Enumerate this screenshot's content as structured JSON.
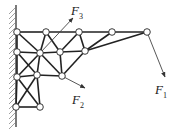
{
  "diagram": {
    "wall": {
      "x": 16,
      "y1": 5,
      "y2": 127
    },
    "nodes": [
      {
        "id": "A",
        "x": 17,
        "y": 32
      },
      {
        "id": "B",
        "x": 46,
        "y": 32
      },
      {
        "id": "C",
        "x": 79,
        "y": 32
      },
      {
        "id": "D",
        "x": 112,
        "y": 32
      },
      {
        "id": "E",
        "x": 147,
        "y": 32
      },
      {
        "id": "F",
        "x": 17,
        "y": 52
      },
      {
        "id": "G",
        "x": 40,
        "y": 53
      },
      {
        "id": "H",
        "x": 60,
        "y": 52
      },
      {
        "id": "I",
        "x": 85,
        "y": 51
      },
      {
        "id": "J",
        "x": 17,
        "y": 77
      },
      {
        "id": "K",
        "x": 37,
        "y": 75
      },
      {
        "id": "L",
        "x": 62,
        "y": 76
      },
      {
        "id": "M",
        "x": 16,
        "y": 107
      },
      {
        "id": "N",
        "x": 40,
        "y": 107
      }
    ],
    "members": [
      [
        "A",
        "B"
      ],
      [
        "B",
        "C"
      ],
      [
        "C",
        "D"
      ],
      [
        "D",
        "E"
      ],
      [
        "A",
        "F"
      ],
      [
        "F",
        "J"
      ],
      [
        "J",
        "M"
      ],
      [
        "F",
        "G"
      ],
      [
        "G",
        "H"
      ],
      [
        "H",
        "I"
      ],
      [
        "J",
        "K"
      ],
      [
        "K",
        "L"
      ],
      [
        "M",
        "N"
      ],
      [
        "A",
        "G"
      ],
      [
        "B",
        "G"
      ],
      [
        "B",
        "H"
      ],
      [
        "C",
        "H"
      ],
      [
        "C",
        "I"
      ],
      [
        "D",
        "I"
      ],
      [
        "E",
        "I"
      ],
      [
        "F",
        "K"
      ],
      [
        "G",
        "K"
      ],
      [
        "G",
        "J"
      ],
      [
        "G",
        "L"
      ],
      [
        "H",
        "L"
      ],
      [
        "I",
        "L"
      ],
      [
        "J",
        "N"
      ],
      [
        "K",
        "N"
      ],
      [
        "K",
        "M"
      ]
    ],
    "forces": [
      {
        "label": "F",
        "sub": "1",
        "from": {
          "x": 147,
          "y": 32
        },
        "to": {
          "x": 165,
          "y": 77
        },
        "label_pos": {
          "x": 155,
          "y": 83
        }
      },
      {
        "label": "F",
        "sub": "2",
        "from": {
          "x": 62,
          "y": 76
        },
        "to": {
          "x": 85,
          "y": 88
        },
        "label_pos": {
          "x": 72,
          "y": 93
        }
      },
      {
        "label": "F",
        "sub": "3",
        "from": {
          "x": 40,
          "y": 53
        },
        "to": {
          "x": 73,
          "y": 18
        },
        "label_pos": {
          "x": 71,
          "y": 4
        }
      }
    ],
    "colors": {
      "line": "#222222",
      "node_fill": "#ffffff",
      "force": "#444444"
    }
  }
}
